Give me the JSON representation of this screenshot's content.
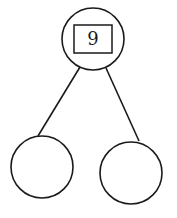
{
  "diagram": {
    "type": "number-bond",
    "whole": {
      "value": "9",
      "boxed": true
    },
    "parts": [
      {
        "value": ""
      },
      {
        "value": ""
      }
    ],
    "stroke_color": "#1a1a1a",
    "background": "#ffffff"
  }
}
